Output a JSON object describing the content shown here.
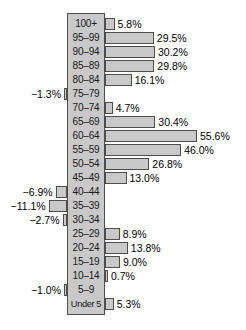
{
  "chart_data": {
    "type": "bar",
    "orientation": "horizontal",
    "title": "",
    "subtitle": "",
    "xlabel": "",
    "ylabel": "",
    "grid": false,
    "legend": null,
    "axis_baseline": 0,
    "value_unit": "%",
    "categories": [
      "100+",
      "95–99",
      "90–94",
      "85–89",
      "80–84",
      "75–79",
      "70–74",
      "65–69",
      "60–64",
      "55–59",
      "50–54",
      "45–49",
      "40–44",
      "35–39",
      "30–34",
      "25–29",
      "20–24",
      "15–19",
      "10–14",
      "5–9",
      "Under 5"
    ],
    "values": [
      5.8,
      29.5,
      30.2,
      29.8,
      16.1,
      -1.3,
      4.7,
      30.4,
      55.6,
      46.0,
      26.8,
      13.0,
      -6.9,
      -11.1,
      -2.7,
      8.9,
      13.8,
      9.0,
      0.7,
      -1.0,
      5.3
    ],
    "value_labels": [
      "5.8%",
      "29.5%",
      "30.2%",
      "29.8%",
      "16.1%",
      "−1.3%",
      "4.7%",
      "30.4%",
      "55.6%",
      "46.0%",
      "26.8%",
      "13.0%",
      "−6.9%",
      "−11.1%",
      "−2.7%",
      "8.9%",
      "13.8%",
      "9.0%",
      "0.7%",
      "−1.0%",
      "5.3%"
    ],
    "xlim": [
      -12,
      57
    ],
    "colors": {
      "bar_fill": "#c9c9c9",
      "bar_stroke": "#4d4d4d",
      "band_fill": "#c9c9c9",
      "text": "#000000",
      "background": "#ffffff"
    }
  }
}
